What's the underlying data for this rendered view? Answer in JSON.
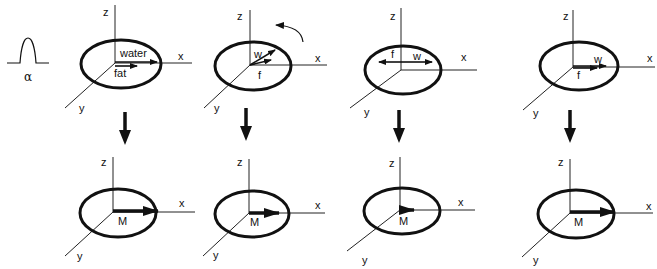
{
  "figure": {
    "pulse_label": "α",
    "axis_labels": {
      "x": "x",
      "y": "y",
      "z": "z"
    },
    "top_row": [
      {
        "id": "p1",
        "vector_labels": [
          "water",
          "fat"
        ],
        "description": "water and fat vectors aligned along x"
      },
      {
        "id": "p2",
        "vector_labels": [
          "w",
          "f"
        ],
        "description": "water vector rotated ahead of fat (precession arrow shown)"
      },
      {
        "id": "p3",
        "vector_labels": [
          "f",
          "w"
        ],
        "description": "fat and water vectors opposed"
      },
      {
        "id": "p4",
        "vector_labels": [
          "w",
          "f"
        ],
        "description": "water and fat vectors re-aligned along x"
      }
    ],
    "bottom_row": [
      {
        "id": "m1",
        "label": "M",
        "magnitude": "large"
      },
      {
        "id": "m2",
        "label": "M",
        "magnitude": "medium"
      },
      {
        "id": "m3",
        "label": "M",
        "magnitude": "small"
      },
      {
        "id": "m4",
        "label": "M",
        "magnitude": "large"
      }
    ],
    "colors": {
      "ink": "#111111",
      "background": "#ffffff"
    }
  }
}
